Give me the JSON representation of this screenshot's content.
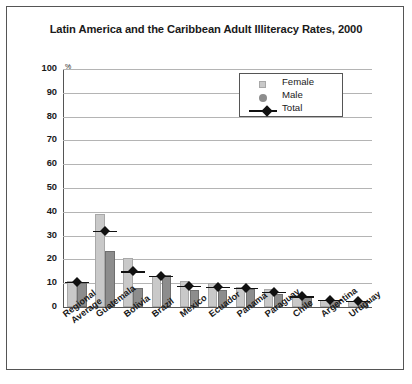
{
  "chart": {
    "title": "Latin America and the Caribbean Adult Illiteracy Rates, 2000",
    "y_unit": "%"
  },
  "legend": {
    "items": [
      {
        "label": "Female",
        "marker": "square",
        "color": "#c9c9c9"
      },
      {
        "label": "Male",
        "marker": "circle",
        "color": "#8d8d8d"
      },
      {
        "label": "Total",
        "marker": "diamond-line",
        "color": "#111111"
      }
    ]
  },
  "y_axis": {
    "ticks": [
      "100",
      "90",
      "80",
      "70",
      "60",
      "50",
      "40",
      "30",
      "20",
      "10",
      "0"
    ]
  },
  "chart_data": {
    "type": "bar",
    "title": "Latin America and the Caribbean Adult Illiteracy Rates, 2000",
    "xlabel": "",
    "ylabel": "%",
    "ylim": [
      0,
      100
    ],
    "ytick_step": 10,
    "grid": true,
    "legend_position": "top-right",
    "categories": [
      "Regional Average",
      "Guatemala",
      "Bolivia",
      "Brazil",
      "Mexico",
      "Ecuador",
      "Panama",
      "Paraguay",
      "Chile",
      "Argentina",
      "Uruguay"
    ],
    "series": [
      {
        "name": "Female",
        "type": "bar",
        "color": "#c9c9c9",
        "values": [
          11,
          39,
          20.5,
          13,
          11,
          10,
          8.5,
          7.5,
          4.5,
          3,
          2.5
        ]
      },
      {
        "name": "Male",
        "type": "bar",
        "color": "#8d8d8d",
        "values": [
          10,
          23.5,
          8,
          13.5,
          7,
          7,
          7.5,
          5.5,
          4.5,
          3,
          2.5
        ]
      },
      {
        "name": "Total",
        "type": "marker-line",
        "color": "#111111",
        "values": [
          10.5,
          32,
          15,
          13,
          9,
          8.5,
          8,
          6.5,
          4.5,
          3,
          2.5
        ]
      }
    ]
  }
}
